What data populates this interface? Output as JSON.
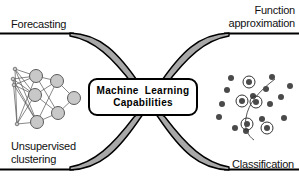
{
  "figure": {
    "title": "Machine Learning Capabilities",
    "background_color": "#ffffff",
    "ink_color": "#000000",
    "ribbon_fill": "#a8a8a8",
    "node_fill": "#c8c8c8",
    "dot_fill": "#4a4a4a"
  },
  "center": {
    "line1": "Machine  Learning",
    "line2": "Capabilities"
  },
  "labels": {
    "top_left": "Forecasting",
    "top_right_line1": "Function",
    "top_right_line2": "approximation",
    "bottom_left_line1": "Unsupervised",
    "bottom_left_line2": "clustering",
    "bottom_right": "Classification"
  },
  "icons": {
    "neural_network": {
      "name": "neural-network-diagram",
      "input_nodes": [
        {
          "x": 15,
          "y": 69,
          "r": 1.8
        },
        {
          "x": 13,
          "y": 79,
          "r": 1.8
        },
        {
          "x": 14,
          "y": 85,
          "r": 1.8
        },
        {
          "x": 17,
          "y": 124,
          "r": 1.8
        }
      ],
      "hidden_nodes": [
        {
          "x": 36,
          "y": 76,
          "r": 6.5
        },
        {
          "x": 35,
          "y": 95,
          "r": 6.5
        },
        {
          "x": 37,
          "y": 122,
          "r": 6.5
        },
        {
          "x": 57,
          "y": 81,
          "r": 6.5
        },
        {
          "x": 58,
          "y": 113,
          "r": 6.5
        }
      ],
      "output_nodes": [
        {
          "x": 74,
          "y": 98,
          "r": 6.5
        }
      ]
    },
    "classification_scatter": {
      "name": "classification-scatter-plot",
      "plain_dots": [
        {
          "x": 227,
          "y": 90
        },
        {
          "x": 222,
          "y": 104
        },
        {
          "x": 219,
          "y": 117
        },
        {
          "x": 235,
          "y": 128
        },
        {
          "x": 231,
          "y": 78
        },
        {
          "x": 253,
          "y": 96
        },
        {
          "x": 266,
          "y": 89
        },
        {
          "x": 272,
          "y": 77
        },
        {
          "x": 270,
          "y": 104
        },
        {
          "x": 281,
          "y": 97
        },
        {
          "x": 284,
          "y": 118
        },
        {
          "x": 262,
          "y": 119
        },
        {
          "x": 246,
          "y": 131
        },
        {
          "x": 290,
          "y": 86
        }
      ],
      "circled_dots": [
        {
          "x": 249,
          "y": 82
        },
        {
          "x": 242,
          "y": 101
        },
        {
          "x": 256,
          "y": 102
        },
        {
          "x": 247,
          "y": 124
        },
        {
          "x": 267,
          "y": 128
        }
      ]
    }
  }
}
